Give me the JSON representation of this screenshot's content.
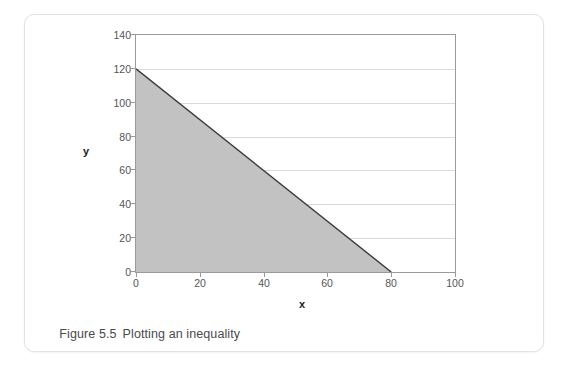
{
  "figure": {
    "caption_label": "Figure 5.5",
    "caption_text": "Plotting an inequality"
  },
  "chart_data": {
    "type": "area",
    "title": "",
    "subtitle": "",
    "xlabel": "x",
    "ylabel": "y",
    "xlim": [
      0,
      100
    ],
    "ylim": [
      0,
      140
    ],
    "xticks": [
      0,
      20,
      40,
      60,
      80,
      100
    ],
    "yticks": [
      0,
      20,
      40,
      60,
      80,
      100,
      120,
      140
    ],
    "grid": "horizontal",
    "legend": "none",
    "series": [
      {
        "name": "Inequality boundary",
        "type": "line",
        "x": [
          0,
          80
        ],
        "y": [
          120,
          0
        ],
        "line_color": "#3a3a3a",
        "fill_color": "#c2c2c2",
        "fill_to": "origin",
        "region_vertices": [
          [
            0,
            0
          ],
          [
            0,
            120
          ],
          [
            80,
            0
          ]
        ]
      }
    ],
    "annotations": []
  },
  "colors": {
    "fill": "#c2c2c2",
    "boundary_line": "#3a3a3a",
    "gridline": "#d9d9d9",
    "axis": "#9a9a9a",
    "tick_text": "#555555",
    "caption_text": "#4a4a4a",
    "card_border": "#e2e2e2"
  }
}
